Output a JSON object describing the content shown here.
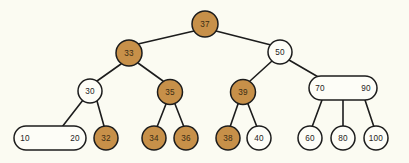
{
  "diagram": {
    "background_color": "#fbfbf2",
    "highlight_color": "#c79049",
    "plain_color": "#fdfdf7",
    "stroke_color": "#1c1c1c",
    "nodes": [
      {
        "id": "n37",
        "labels": [
          "37"
        ],
        "shape": "circle",
        "filled": true,
        "cx": 205,
        "cy": 24,
        "r": 13
      },
      {
        "id": "n33",
        "labels": [
          "33"
        ],
        "shape": "circle",
        "filled": true,
        "cx": 129,
        "cy": 53,
        "r": 13
      },
      {
        "id": "n50",
        "labels": [
          "50"
        ],
        "shape": "circle",
        "filled": false,
        "cx": 280,
        "cy": 52,
        "r": 12
      },
      {
        "id": "n30",
        "labels": [
          "30"
        ],
        "shape": "circle",
        "filled": false,
        "cx": 90,
        "cy": 91,
        "r": 12
      },
      {
        "id": "n35",
        "labels": [
          "35"
        ],
        "shape": "circle",
        "filled": true,
        "cx": 170,
        "cy": 92,
        "r": 12.5
      },
      {
        "id": "n39",
        "labels": [
          "39"
        ],
        "shape": "circle",
        "filled": true,
        "cx": 243,
        "cy": 92,
        "r": 12.5
      },
      {
        "id": "n7090",
        "labels": [
          "70",
          "90"
        ],
        "shape": "oval",
        "filled": false,
        "cx": 343,
        "cy": 88,
        "w": 68,
        "h": 24
      },
      {
        "id": "n1020",
        "labels": [
          "10",
          "20"
        ],
        "shape": "oval",
        "filled": false,
        "cx": 50,
        "cy": 138,
        "w": 72,
        "h": 24
      },
      {
        "id": "n32",
        "labels": [
          "32"
        ],
        "shape": "circle",
        "filled": true,
        "cx": 106,
        "cy": 138,
        "r": 12
      },
      {
        "id": "n34",
        "labels": [
          "34"
        ],
        "shape": "circle",
        "filled": true,
        "cx": 154,
        "cy": 138,
        "r": 12
      },
      {
        "id": "n36",
        "labels": [
          "36"
        ],
        "shape": "circle",
        "filled": true,
        "cx": 186,
        "cy": 138,
        "r": 12
      },
      {
        "id": "n38",
        "labels": [
          "38"
        ],
        "shape": "circle",
        "filled": true,
        "cx": 228,
        "cy": 138,
        "r": 12
      },
      {
        "id": "n40",
        "labels": [
          "40"
        ],
        "shape": "circle",
        "filled": false,
        "cx": 259,
        "cy": 138,
        "r": 12
      },
      {
        "id": "n60",
        "labels": [
          "60"
        ],
        "shape": "circle",
        "filled": false,
        "cx": 310,
        "cy": 138,
        "r": 12
      },
      {
        "id": "n80",
        "labels": [
          "80"
        ],
        "shape": "circle",
        "filled": false,
        "cx": 343,
        "cy": 138,
        "r": 12
      },
      {
        "id": "n100",
        "labels": [
          "100"
        ],
        "shape": "circle",
        "filled": false,
        "cx": 376,
        "cy": 138,
        "r": 12
      }
    ],
    "edges": [
      {
        "from": "n37",
        "to": "n33",
        "x1": 194,
        "y1": 31,
        "x2": 138,
        "y2": 44
      },
      {
        "from": "n37",
        "to": "n50",
        "x1": 216,
        "y1": 31,
        "x2": 271,
        "y2": 45
      },
      {
        "from": "n33",
        "to": "n30",
        "x1": 121,
        "y1": 64,
        "x2": 97,
        "y2": 81
      },
      {
        "from": "n33",
        "to": "n35",
        "x1": 138,
        "y1": 63,
        "x2": 163,
        "y2": 81
      },
      {
        "from": "n50",
        "to": "n39",
        "x1": 272,
        "y1": 61,
        "x2": 250,
        "y2": 81
      },
      {
        "from": "n50",
        "to": "n7090",
        "x1": 289,
        "y1": 60,
        "x2": 320,
        "y2": 78
      },
      {
        "from": "n30",
        "to": "n1020",
        "x1": 83,
        "y1": 100,
        "x2": 62,
        "y2": 127
      },
      {
        "from": "n30",
        "to": "n32",
        "x1": 97,
        "y1": 101,
        "x2": 104,
        "y2": 126
      },
      {
        "from": "n35",
        "to": "n34",
        "x1": 166,
        "y1": 104,
        "x2": 157,
        "y2": 127
      },
      {
        "from": "n35",
        "to": "n36",
        "x1": 175,
        "y1": 104,
        "x2": 184,
        "y2": 127
      },
      {
        "from": "n39",
        "to": "n38",
        "x1": 238,
        "y1": 104,
        "x2": 230,
        "y2": 127
      },
      {
        "from": "n39",
        "to": "n40",
        "x1": 248,
        "y1": 104,
        "x2": 257,
        "y2": 127
      },
      {
        "from": "n7090",
        "to": "n60",
        "x1": 322,
        "y1": 100,
        "x2": 312,
        "y2": 127
      },
      {
        "from": "n7090",
        "to": "n80",
        "x1": 343,
        "y1": 100,
        "x2": 343,
        "y2": 127
      },
      {
        "from": "n7090",
        "to": "n100",
        "x1": 365,
        "y1": 100,
        "x2": 374,
        "y2": 127
      }
    ]
  }
}
